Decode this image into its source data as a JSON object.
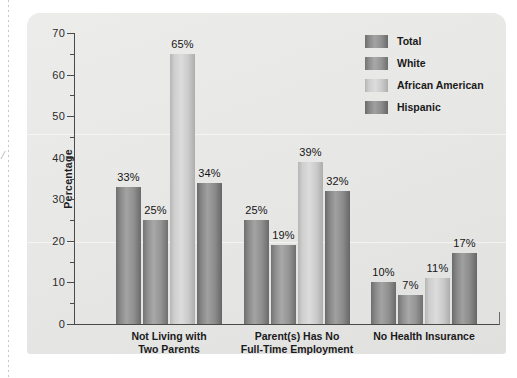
{
  "chart_data": {
    "type": "bar",
    "title": "",
    "xlabel": "",
    "ylabel": "Percentage",
    "ylim": [
      0,
      70
    ],
    "ytick_step": 10,
    "yminor_step": 5,
    "ytick_labels": [
      "0",
      "10",
      "20",
      "30",
      "40",
      "50",
      "60",
      "70"
    ],
    "grid": false,
    "legend_position": "top-right",
    "value_suffix": "%",
    "categories": [
      "Not Living with Two Parents",
      "Parent(s) Has No Full-Time Employment",
      "No Health Insurance"
    ],
    "category_lines": [
      [
        "Not Living with",
        "Two Parents"
      ],
      [
        "Parent(s) Has No",
        "Full-Time Employment"
      ],
      [
        "No Health Insurance",
        ""
      ]
    ],
    "series": [
      {
        "name": "Total",
        "color": "#8f8f8f",
        "values": [
          33,
          25,
          10
        ],
        "labels": [
          "33%",
          "25%",
          "10%"
        ]
      },
      {
        "name": "White",
        "color": "#949494",
        "values": [
          25,
          19,
          7
        ],
        "labels": [
          "25%",
          "19%",
          "7%"
        ]
      },
      {
        "name": "African American",
        "color": "#cfcfcf",
        "values": [
          65,
          39,
          11
        ],
        "labels": [
          "65%",
          "39%",
          "11%"
        ]
      },
      {
        "name": "Hispanic",
        "color": "#8b8b8b",
        "values": [
          34,
          32,
          17
        ],
        "labels": [
          "34%",
          "32%",
          "17%"
        ]
      }
    ]
  },
  "legend": {
    "items": [
      {
        "label": "Total"
      },
      {
        "label": "White"
      },
      {
        "label": "African American"
      },
      {
        "label": "Hispanic"
      }
    ]
  },
  "page_artifact": {
    "margin_mark": "/"
  }
}
